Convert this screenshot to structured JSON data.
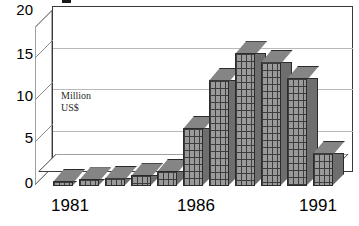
{
  "chart_data": {
    "type": "bar",
    "title": "",
    "xlabel": "",
    "ylabel": "Million US$",
    "annotation": [
      "Million",
      "US$"
    ],
    "categories": [
      "1981",
      "1982",
      "1983",
      "1984",
      "1985",
      "1986",
      "1987",
      "1988",
      "1989",
      "1990",
      "1991"
    ],
    "x_tick_labels": [
      "1981",
      "1986",
      "1991"
    ],
    "values": [
      0.5,
      0.8,
      1.0,
      1.3,
      1.8,
      7.0,
      12.8,
      16.0,
      15.0,
      13.0,
      4.0
    ],
    "y_tick_labels": [
      "20",
      "15",
      "10",
      "5",
      "0"
    ],
    "y_tick_values": [
      20,
      15,
      10,
      5,
      0
    ],
    "ylim": [
      0,
      20
    ],
    "grid": true,
    "legend": "none",
    "style": "3d-bar",
    "colors": {
      "bar_front": "#9a9a9a",
      "bar_side": "#6e6e6e",
      "bar_top": "#858585",
      "outline": "#2b2b2b",
      "gridline": "#b9b9b9",
      "background": "#ffffff",
      "text": "#000000"
    }
  },
  "axis": {
    "y_ticks": [
      {
        "label": "20",
        "top": 2
      },
      {
        "label": "15",
        "top": 46
      },
      {
        "label": "10",
        "top": 88
      },
      {
        "label": "5",
        "top": 130
      },
      {
        "label": "0",
        "top": 175
      }
    ],
    "x_ticks": [
      {
        "label": "1981",
        "left": 35
      },
      {
        "label": "1986",
        "left": 161
      },
      {
        "label": "1991",
        "left": 283
      }
    ]
  }
}
